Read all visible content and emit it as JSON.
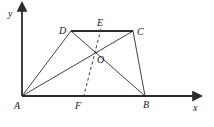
{
  "figure": {
    "type": "geometry-diagram",
    "background_color": "#ffffff",
    "stroke_color": "#2b2b2b",
    "axis_color": "#2b2b2b",
    "dash_color": "#3a3a3a"
  },
  "axes": {
    "x_label": "x",
    "y_label": "y",
    "x_axis": {
      "x1": 22,
      "y1": 96,
      "x2": 196,
      "y2": 96
    },
    "y_axis": {
      "x1": 22,
      "y1": 96,
      "x2": 22,
      "y2": 8
    },
    "x_label_pos": {
      "x": 193,
      "y": 103
    },
    "y_label_pos": {
      "x": 8,
      "y": 9
    }
  },
  "points": [
    {
      "name": "A",
      "label": "A",
      "x": 22,
      "y": 96,
      "label_x": 14,
      "label_y": 101
    },
    {
      "name": "B",
      "label": "B",
      "x": 145,
      "y": 96,
      "label_x": 143,
      "label_y": 100
    },
    {
      "name": "C",
      "label": "C",
      "x": 133,
      "y": 31,
      "label_x": 137,
      "label_y": 27
    },
    {
      "name": "D",
      "label": "D",
      "x": 71,
      "y": 31,
      "label_x": 59,
      "label_y": 26
    },
    {
      "name": "E",
      "label": "E",
      "x": 101,
      "y": 31,
      "label_x": 97,
      "label_y": 18
    },
    {
      "name": "F",
      "label": "F",
      "x": 84,
      "y": 96,
      "label_x": 75,
      "label_y": 101
    },
    {
      "name": "O",
      "label": "O",
      "x": 97,
      "y": 52,
      "label_x": 97,
      "label_y": 55
    }
  ],
  "segments": [
    {
      "name": "side-AD",
      "from": "A",
      "to": "D",
      "style": "solid",
      "weight": "thin"
    },
    {
      "name": "side-DC",
      "from": "D",
      "to": "C",
      "style": "solid",
      "weight": "thick"
    },
    {
      "name": "side-CB",
      "from": "C",
      "to": "B",
      "style": "solid",
      "weight": "thin"
    },
    {
      "name": "side-AB",
      "from": "A",
      "to": "B",
      "style": "solid",
      "weight": "thick"
    },
    {
      "name": "diagonal-AC",
      "from": "A",
      "to": "C",
      "style": "solid",
      "weight": "thin"
    },
    {
      "name": "diagonal-DB",
      "from": "D",
      "to": "B",
      "style": "solid",
      "weight": "thin"
    },
    {
      "name": "segment-EF",
      "from": "E",
      "to": "F",
      "style": "dashed",
      "weight": "thin"
    }
  ]
}
